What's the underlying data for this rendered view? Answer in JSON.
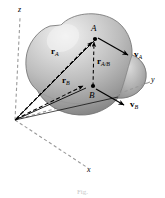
{
  "figure": {
    "kind": "rigid-body-kinematics-diagram",
    "caption": "Fig."
  },
  "axes": {
    "z": {
      "label": "z",
      "style": "dashed",
      "direction": "up"
    },
    "y": {
      "label": "y",
      "style": "dashed",
      "direction": "up-right"
    },
    "x": {
      "label": "x",
      "style": "dashed",
      "direction": "down-right"
    },
    "origin_label": ""
  },
  "points": [
    {
      "id": "A",
      "label": "A"
    },
    {
      "id": "B",
      "label": "B"
    }
  ],
  "vectors": [
    {
      "id": "rA",
      "glyph": "r",
      "sub": "A",
      "style": "solid",
      "from": "origin",
      "to": "A"
    },
    {
      "id": "rB",
      "glyph": "r",
      "sub": "B",
      "style": "solid",
      "from": "origin",
      "to": "B"
    },
    {
      "id": "rAB",
      "glyph": "r",
      "sub": "A/B",
      "style": "dashed",
      "from": "B",
      "to": "A"
    },
    {
      "id": "vA",
      "glyph": "v",
      "sub": "A",
      "style": "solid",
      "from": "A",
      "to": "free"
    },
    {
      "id": "vB",
      "glyph": "v",
      "sub": "B",
      "style": "solid",
      "from": "B",
      "to": "free"
    }
  ],
  "body": {
    "name": "rigid-body-blob",
    "fill_light": "#e8e8e8",
    "fill_mid": "#b5b5b5",
    "fill_dark": "#7d7d7d",
    "outline": "#6e6e6e"
  },
  "colors": {
    "ink": "#000000",
    "axis": "#9a9a9a",
    "background": "#ffffff"
  }
}
